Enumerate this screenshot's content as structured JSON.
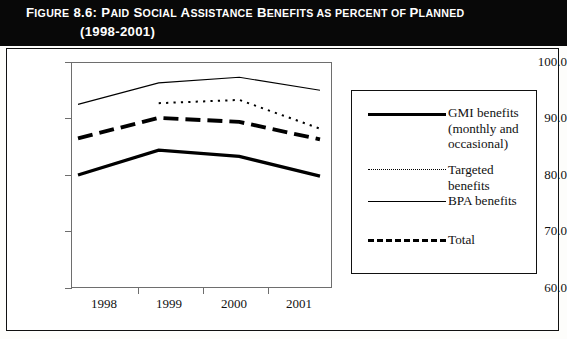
{
  "figure": {
    "title_line1": "FIGURE 8.6: PAID SOCIAL ASSISTANCE BENEFITS AS PERCENT OF PLANNED",
    "title_line2": "(1998-2001)",
    "title_parts": {
      "label": "FIGURE 8.6:",
      "rest": "PAID SOCIAL ASSISTANCE BENEFITS AS PERCENT OF PLANNED",
      "years": "(1998-2001)"
    }
  },
  "chart_data": {
    "type": "line",
    "title": "FIGURE 8.6: PAID SOCIAL ASSISTANCE BENEFITS AS PERCENT OF PLANNED (1998-2001)",
    "xlabel": "",
    "ylabel": "",
    "categories": [
      "1998",
      "1999",
      "2000",
      "2001"
    ],
    "x": [
      1998,
      1999,
      2000,
      2001
    ],
    "ylim": [
      60.0,
      100.0
    ],
    "yticks": [
      60.0,
      70.0,
      80.0,
      90.0,
      100.0
    ],
    "ytick_labels": [
      "60.0",
      "70.0",
      "80.0",
      "90.0",
      "100.0"
    ],
    "grid": false,
    "legend_position": "right",
    "series": [
      {
        "name": "GMI benefits (monthly and occasional)",
        "style": "solid-thick",
        "values": [
          80.0,
          84.4,
          83.3,
          79.8
        ]
      },
      {
        "name": "Targeted benefits",
        "style": "dotted",
        "values": [
          null,
          92.7,
          93.3,
          88.2
        ]
      },
      {
        "name": "BPA benefits",
        "style": "solid-thin",
        "values": [
          92.5,
          96.3,
          97.3,
          95.0
        ]
      },
      {
        "name": "Total",
        "style": "dashed-thick",
        "values": [
          86.5,
          90.1,
          89.4,
          86.3
        ]
      }
    ]
  },
  "axes": {
    "y_ticks": [
      "100.0",
      "90.0",
      "80.0",
      "70.0",
      "60.0"
    ],
    "x_ticks": [
      "1998",
      "1999",
      "2000",
      "2001"
    ]
  },
  "legend": {
    "items": [
      {
        "label_line1": "GMI benefits",
        "label_line2": "(monthly and",
        "label_line3": "occasional)",
        "style": "solid-thick"
      },
      {
        "label_line1": "Targeted benefits",
        "style": "dotted"
      },
      {
        "label_line1": "BPA benefits",
        "style": "solid-thin"
      },
      {
        "label_line1": "Total",
        "style": "dashed-thick"
      }
    ]
  }
}
